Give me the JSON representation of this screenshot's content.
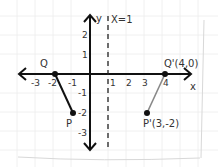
{
  "diagram": {
    "type": "coordinate-plane-reflection",
    "axes": {
      "x_label": "x",
      "y_label": "y",
      "x_ticks": [
        "-3",
        "-2",
        "-1",
        "1",
        "2",
        "3",
        "4"
      ],
      "y_ticks": [
        "2",
        "1",
        "-1",
        "-2",
        "-3"
      ]
    },
    "line_of_reflection": {
      "label": "x = 1",
      "label_text": "X=1",
      "style": "dashed"
    },
    "points": {
      "Q": {
        "label": "Q",
        "coords": [
          -2,
          0
        ]
      },
      "P": {
        "label": "P",
        "coords": [
          -1,
          -2
        ]
      },
      "Q_prime": {
        "label": "Q'(4,0)",
        "coords": [
          4,
          0
        ]
      },
      "P_prime": {
        "label": "P'(3,-2)",
        "coords": [
          3,
          -2
        ]
      }
    },
    "segments": [
      {
        "name": "PQ",
        "from": "Q",
        "to": "P",
        "color": "#111111"
      },
      {
        "name": "P'Q'",
        "from": "Q_prime",
        "to": "P_prime",
        "color": "#888888"
      }
    ]
  }
}
